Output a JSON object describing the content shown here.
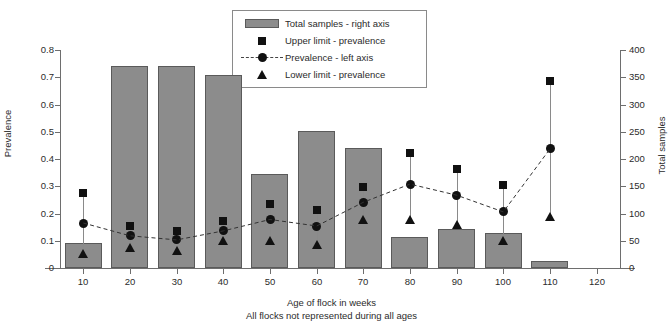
{
  "chart_data": {
    "type": "bar",
    "title": "",
    "xlabel": "Age of flock in weeks",
    "xlabel_note": "All flocks not represented during all ages",
    "ylabel": "Prevalence",
    "y2label": "Total samples",
    "xlim": [
      5,
      125
    ],
    "ylim": [
      0,
      0.8
    ],
    "y2lim": [
      0,
      400
    ],
    "grid": false,
    "legend_position": "top-center",
    "x_ticks": [
      10,
      20,
      30,
      40,
      50,
      60,
      70,
      80,
      90,
      100,
      110,
      120
    ],
    "y_ticks": [
      0,
      0.1,
      0.2,
      0.3,
      0.4,
      0.5,
      0.6,
      0.7,
      0.8
    ],
    "y_tick_labels": [
      "0",
      "0.1",
      "0.2",
      "0.3",
      "0.4",
      "0.5",
      "0.6",
      "0.7",
      "0.8"
    ],
    "y2_ticks": [
      0,
      50,
      100,
      150,
      200,
      250,
      300,
      350,
      400
    ],
    "y2_tick_labels": [
      "0",
      "50",
      "100",
      "150",
      "200",
      "250",
      "300",
      "350",
      "400"
    ],
    "categories": [
      10,
      20,
      30,
      40,
      50,
      60,
      70,
      80,
      90,
      100,
      110
    ],
    "series": [
      {
        "name": "Total samples - right axis",
        "type": "bar",
        "axis": "right",
        "color": "#8c8c8c",
        "values": [
          45,
          370,
          370,
          355,
          172,
          252,
          220,
          56,
          72,
          64,
          12
        ]
      },
      {
        "name": "Upper limit - prevalence",
        "type": "scatter-square",
        "axis": "left",
        "color": "#111111",
        "values": [
          0.275,
          0.153,
          0.135,
          0.172,
          0.236,
          0.213,
          0.299,
          0.421,
          0.365,
          0.304,
          0.685
        ]
      },
      {
        "name": "Prevalence - left axis",
        "type": "line-dashed-circle",
        "axis": "left",
        "color": "#111111",
        "values": [
          0.165,
          0.118,
          0.103,
          0.136,
          0.178,
          0.154,
          0.241,
          0.308,
          0.267,
          0.206,
          0.437
        ]
      },
      {
        "name": "Lower limit - prevalence",
        "type": "scatter-triangle",
        "axis": "left",
        "color": "#111111",
        "values": [
          0.055,
          0.078,
          0.065,
          0.102,
          0.101,
          0.088,
          0.178,
          0.178,
          0.163,
          0.104,
          0.19
        ]
      }
    ]
  },
  "legend": {
    "items": [
      {
        "label": "Total samples - right axis",
        "key": "bar-swatch-icon"
      },
      {
        "label": "Upper limit - prevalence",
        "key": "square-marker-icon"
      },
      {
        "label": "Prevalence - left axis",
        "key": "dashed-line-circle-icon"
      },
      {
        "label": "Lower limit - prevalence",
        "key": "triangle-marker-icon"
      }
    ]
  },
  "axes": {
    "left_title": "Prevalence",
    "right_title": "Total samples",
    "bottom_title": "Age of flock in weeks",
    "bottom_note": "All flocks not represented during all ages"
  }
}
